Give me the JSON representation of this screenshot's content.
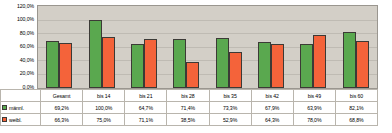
{
  "chart_data": {
    "type": "bar",
    "title": "",
    "xlabel": "",
    "ylabel": "",
    "ylim": [
      0,
      120
    ],
    "grid": true,
    "legend_position": "bottom-left-table",
    "categories": [
      "Gesamt",
      "bis 14",
      "bis 21",
      "bis 28",
      "bis 35",
      "bis 42",
      "bis 49",
      "bis 60"
    ],
    "y_ticks": [
      "0,0%",
      "20,0%",
      "40,0%",
      "60,0%",
      "80,0%",
      "100,0%",
      "120,0%"
    ],
    "y_tick_values": [
      0,
      20,
      40,
      60,
      80,
      100,
      120
    ],
    "series": [
      {
        "name": "männl.",
        "color": "#5aa84f",
        "values": [
          69.2,
          100.0,
          64.7,
          71.4,
          73.3,
          67.9,
          63.9,
          82.1
        ],
        "labels": [
          "69,2%",
          "100,0%",
          "64,7%",
          "71,4%",
          "73,3%",
          "67,9%",
          "63,9%",
          "82,1%"
        ]
      },
      {
        "name": "weibl.",
        "color": "#f4633a",
        "values": [
          66.3,
          75.0,
          71.1,
          38.5,
          52.9,
          64.3,
          78.0,
          68.8
        ],
        "labels": [
          "66,3%",
          "75,0%",
          "71,1%",
          "38,5%",
          "52,9%",
          "64,3%",
          "78,0%",
          "68,8%"
        ]
      }
    ]
  },
  "axis": {
    "ticks": [
      "120,0%",
      "100,0%",
      "80,0%",
      "60,0%",
      "40,0%",
      "20,0%",
      "0,0%"
    ]
  },
  "table": {
    "categories": [
      "Gesamt",
      "bis 14",
      "bis 21",
      "bis 28",
      "bis 35",
      "bis 42",
      "bis 49",
      "bis 60"
    ],
    "rows": [
      {
        "label": "männl.",
        "swatch": "green-swatch",
        "values": [
          "69,2%",
          "100,0%",
          "64,7%",
          "71,4%",
          "73,3%",
          "67,9%",
          "63,9%",
          "82,1%"
        ]
      },
      {
        "label": "weibl.",
        "swatch": "orange-swatch",
        "values": [
          "66,3%",
          "75,0%",
          "71,1%",
          "38,5%",
          "52,9%",
          "64,3%",
          "78,0%",
          "68,8%"
        ]
      }
    ]
  }
}
